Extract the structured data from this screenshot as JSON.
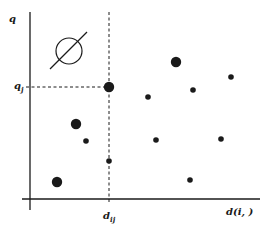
{
  "diagram": {
    "colors": {
      "ink": "#1a1a1a",
      "background": "#ffffff"
    },
    "axes": {
      "y_axis": {
        "x": 30,
        "y1": 12,
        "y2": 210,
        "label": "q",
        "label_pos": [
          9,
          14
        ]
      },
      "x_axis": {
        "y": 199,
        "x1": 22,
        "x2": 260,
        "label": "d(i, )",
        "label_pos": [
          226,
          207
        ]
      }
    },
    "reference": {
      "q_j": {
        "base": "q",
        "sub": "j",
        "y": 87,
        "label_pos": [
          14,
          81
        ]
      },
      "d_ij": {
        "base": "d",
        "sub": "ij",
        "x": 109,
        "label_pos": [
          103,
          211
        ]
      }
    },
    "symbol": {
      "name": "empty-set",
      "cx": 69,
      "cy": 51,
      "r": 13,
      "line": [
        50,
        69,
        87,
        32
      ]
    },
    "points": [
      {
        "x": 109,
        "y": 87,
        "size": "large"
      },
      {
        "x": 176,
        "y": 62,
        "size": "large"
      },
      {
        "x": 76,
        "y": 124,
        "size": "large"
      },
      {
        "x": 57,
        "y": 182,
        "size": "large"
      },
      {
        "x": 148,
        "y": 97,
        "size": "small"
      },
      {
        "x": 193,
        "y": 90,
        "size": "small"
      },
      {
        "x": 231,
        "y": 77,
        "size": "small"
      },
      {
        "x": 86,
        "y": 141,
        "size": "small"
      },
      {
        "x": 109,
        "y": 161,
        "size": "small"
      },
      {
        "x": 156,
        "y": 140,
        "size": "small"
      },
      {
        "x": 221,
        "y": 139,
        "size": "small"
      },
      {
        "x": 190,
        "y": 180,
        "size": "small"
      }
    ]
  }
}
